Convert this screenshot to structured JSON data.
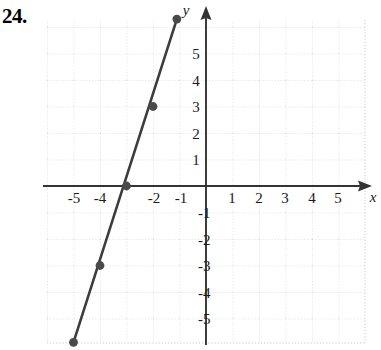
{
  "problem": {
    "number": "24."
  },
  "chart_data": {
    "type": "line",
    "title": "",
    "xlabel": "x",
    "ylabel": "y",
    "grid": true,
    "legend": "none",
    "xlim": [
      -6,
      6
    ],
    "ylim": [
      -6.2,
      6.4
    ],
    "x_ticks": [
      -5,
      -4,
      -3,
      -2,
      -1,
      1,
      2,
      3,
      4,
      5
    ],
    "x_tick_labels": [
      "-5",
      "-4",
      "",
      "-2",
      "-1",
      "1",
      "2",
      "3",
      "4",
      "5"
    ],
    "y_ticks": [
      5,
      4,
      3,
      2,
      1,
      -1,
      -2,
      -3,
      -4,
      -5
    ],
    "y_tick_labels": [
      "5",
      "4",
      "3",
      "2",
      "1",
      "-1",
      "-2",
      "-3",
      "-4",
      "-5"
    ],
    "series": [
      {
        "name": "line",
        "slope": 3,
        "y_intercept": 9,
        "equation": "y = 3x + 9",
        "endpoints": [
          {
            "x": -5,
            "y": -5.9
          },
          {
            "x": -1.1,
            "y": 6.3
          }
        ],
        "marked_points": [
          {
            "x": -4,
            "y": -3
          },
          {
            "x": -3,
            "y": 0
          },
          {
            "x": -2,
            "y": 3
          }
        ],
        "endpoint_markers": [
          {
            "x": -5,
            "y": -5.9
          },
          {
            "x": -1.1,
            "y": 6.3
          }
        ],
        "color": "#3d3d3d"
      }
    ],
    "colors": {
      "grid": "#c9c9c9",
      "axis": "#333333",
      "line": "#3d3d3d",
      "point": "#4a4a4a",
      "text": "#1a1a1a"
    }
  }
}
